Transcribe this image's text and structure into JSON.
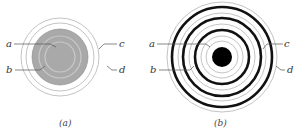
{
  "figure_a": {
    "caption": "(a)",
    "labels": {
      "a": "a",
      "b": "b",
      "c": "c",
      "d": "d"
    },
    "colors": {
      "disk": "#a8a8a8",
      "outline": "#bdbdbd"
    }
  },
  "figure_b": {
    "caption": "(b)",
    "labels": {
      "a": "a",
      "b": "b",
      "c": "c",
      "d": "d"
    },
    "colors": {
      "thick_ring": "#111111",
      "thin_ring": "#bdbdbd",
      "center": "#000000"
    }
  }
}
